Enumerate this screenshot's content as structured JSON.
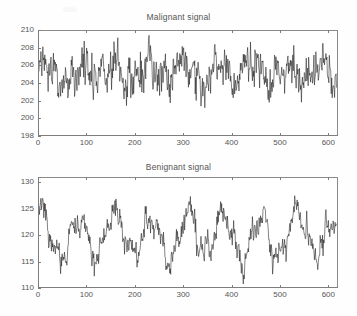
{
  "page": {
    "background": "#fefefe",
    "axis_color": "#7d7d7d",
    "trace_color": "#1c1c1c",
    "text_color": "#555555"
  },
  "chart_data": [
    {
      "type": "line",
      "title": "Malignant signal",
      "xlabel": "",
      "ylabel": "",
      "xlim": [
        0,
        620
      ],
      "ylim": [
        198,
        210
      ],
      "xticks": [
        0,
        100,
        200,
        300,
        400,
        500,
        600
      ],
      "yticks": [
        198,
        200,
        202,
        204,
        206,
        208,
        210
      ],
      "xtick_labels": [
        "0",
        "100",
        "200",
        "300",
        "400",
        "500",
        "600"
      ],
      "ytick_labels": [
        "198",
        "200",
        "202",
        "204",
        "206",
        "208",
        "210"
      ],
      "grid": false,
      "legend": null,
      "series": [
        {
          "name": "malignant",
          "color": "#1c1c1c",
          "n_points": 620,
          "mean": 205.1,
          "noise_std": 1.35,
          "description": "dense noisy trace oscillating about 205 with quasi-periodic bursts reaching 209 and dips to 198.5",
          "components": [
            {
              "amplitude": 1.15,
              "period": 72,
              "phase": 0.4
            },
            {
              "amplitude": 0.75,
              "period": 33,
              "phase": 1.9
            },
            {
              "amplitude": 0.45,
              "period": 152,
              "phase": 2.7
            },
            {
              "amplitude": 0.35,
              "period": 11,
              "phase": 0.9
            }
          ]
        }
      ]
    },
    {
      "type": "line",
      "title": "Benignant signal",
      "xlabel": "",
      "ylabel": "",
      "xlim": [
        0,
        620
      ],
      "ylim": [
        110,
        131
      ],
      "xticks": [
        0,
        100,
        200,
        300,
        400,
        500,
        600
      ],
      "yticks": [
        110,
        115,
        120,
        125,
        130
      ],
      "xtick_labels": [
        "0",
        "100",
        "200",
        "300",
        "400",
        "500",
        "600"
      ],
      "ytick_labels": [
        "110",
        "115",
        "120",
        "125",
        "130"
      ],
      "grid": false,
      "legend": null,
      "series": [
        {
          "name": "benignant",
          "color": "#1c1c1c",
          "n_points": 620,
          "mean": 119.8,
          "noise_std": 1.5,
          "description": "noisy trace about 120 with strong slow oscillation peaking near 130 and troughs near 111",
          "components": [
            {
              "amplitude": 3.9,
              "period": 76,
              "phase": 1.1
            },
            {
              "amplitude": 1.5,
              "period": 31,
              "phase": 0.3
            },
            {
              "amplitude": 1.0,
              "period": 188,
              "phase": 2.2
            },
            {
              "amplitude": 0.6,
              "period": 13,
              "phase": 1.6
            }
          ]
        }
      ]
    }
  ]
}
